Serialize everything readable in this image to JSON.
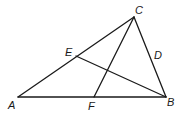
{
  "diagram": {
    "type": "geometry-triangle",
    "points": {
      "A": {
        "label": "A",
        "x": 18,
        "y": 97
      },
      "B": {
        "label": "B",
        "x": 166,
        "y": 97
      },
      "C": {
        "label": "C",
        "x": 134,
        "y": 17
      },
      "E": {
        "label": "E",
        "x": 76,
        "y": 56
      },
      "F": {
        "label": "F",
        "x": 94,
        "y": 97
      }
    },
    "labels": {
      "A": "A",
      "B": "B",
      "C": "C",
      "D": "D",
      "E": "E",
      "F": "F"
    },
    "segments": [
      {
        "from": "A",
        "to": "B"
      },
      {
        "from": "B",
        "to": "C"
      },
      {
        "from": "C",
        "to": "A"
      },
      {
        "from": "C",
        "to": "F"
      },
      {
        "from": "B",
        "to": "E"
      }
    ],
    "stroke_color": "#1a1a1a",
    "background": "#ffffff"
  }
}
